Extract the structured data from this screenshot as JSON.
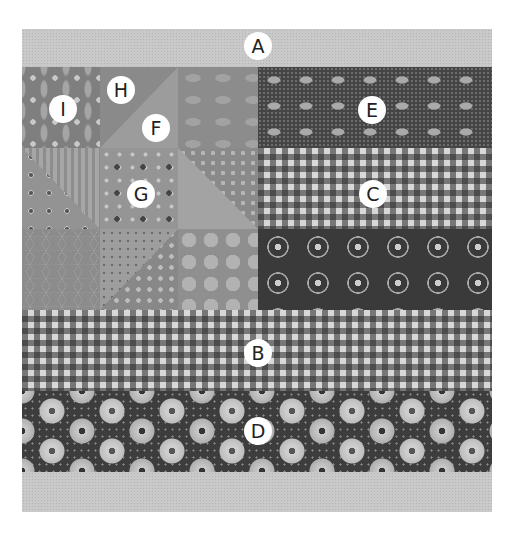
{
  "figure": {
    "type": "quilt-block-diagram"
  },
  "regions": [
    {
      "id": "A",
      "label": "A",
      "pattern": "light-gray-dot-border"
    },
    {
      "id": "B",
      "label": "B",
      "pattern": "gingham-full-width"
    },
    {
      "id": "C",
      "label": "C",
      "pattern": "gingham-right-half"
    },
    {
      "id": "D",
      "label": "D",
      "pattern": "dark-daisy-floral"
    },
    {
      "id": "E",
      "label": "E",
      "pattern": "dark-dog-print"
    },
    {
      "id": "F",
      "label": "F",
      "pattern": "light-pinwheel-triangle"
    },
    {
      "id": "G",
      "label": "G",
      "pattern": "floral-pinwheel-triangle"
    },
    {
      "id": "H",
      "label": "H",
      "pattern": "leaf-pinwheel-triangle"
    },
    {
      "id": "I",
      "label": "I",
      "pattern": "petal-lattice-square"
    }
  ],
  "colors": {
    "background": "#ffffff",
    "border_fabric": "#c9c9c9",
    "dark_fabric": "#3e3e3e",
    "mid_fabric": "#8f8f8f",
    "label_bg": "#ffffff",
    "label_text": "#222222"
  }
}
